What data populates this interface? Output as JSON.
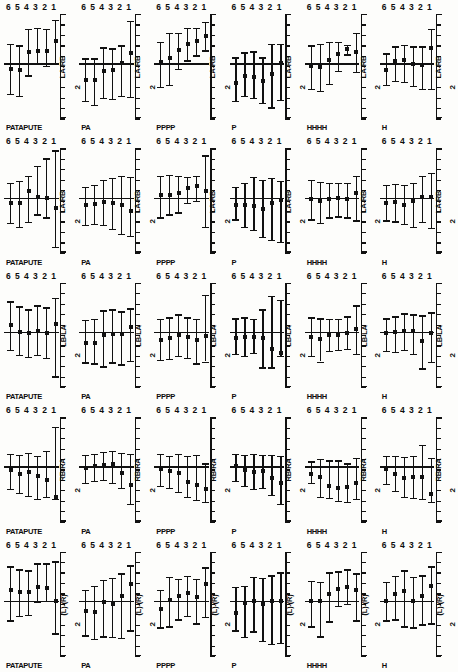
{
  "figure": {
    "title": "",
    "layout": {
      "rows": 5,
      "cols": 6
    }
  },
  "columns": [
    {
      "id": "col-1",
      "caption": "PATAPUTE"
    },
    {
      "id": "col-2",
      "caption": "PA"
    },
    {
      "id": "col-3",
      "caption": "PPPP"
    },
    {
      "id": "col-4",
      "caption": "P"
    },
    {
      "id": "col-5",
      "caption": "HHHH"
    },
    {
      "id": "col-6",
      "caption": "H"
    }
  ],
  "rows": [
    {
      "id": "row-1",
      "ylabel": "LA-RB",
      "yunit": "2"
    },
    {
      "id": "row-2",
      "ylabel": "LA-RB",
      "yunit": "2"
    },
    {
      "id": "row-3",
      "ylabel": "LB-LA",
      "yunit": "2"
    },
    {
      "id": "row-4",
      "ylabel": "RB-RA",
      "yunit": "2"
    },
    {
      "id": "row-5",
      "ylabel": "(L)-(R)",
      "yunit": "2"
    }
  ],
  "xticks": [
    "6",
    "5",
    "4",
    "3",
    "2",
    "1"
  ],
  "yaxis": {
    "tick_count": 11,
    "zero_index": 5
  },
  "chart_data": {
    "type": "scatter",
    "title": "",
    "xlabel": "",
    "ylabel": "effect",
    "x": [
      "6",
      "5",
      "4",
      "3",
      "2",
      "1"
    ],
    "ylim": [
      -1,
      1
    ],
    "grid": false,
    "legend": "none",
    "marker": "square",
    "errorbar": "vertical whisker with caps",
    "zero_reference_line": 0,
    "panels": [
      {
        "row": "LA-RB",
        "col": "PATAPUTE",
        "values": [
          -0.12,
          -0.14,
          0.22,
          0.24,
          0.24,
          0.45
        ],
        "lower": [
          -0.62,
          -0.66,
          -0.25,
          0.0,
          -0.05,
          0.0
        ],
        "upper": [
          0.4,
          0.36,
          0.7,
          0.72,
          0.7,
          0.88
        ]
      },
      {
        "row": "LA-RB",
        "col": "PA",
        "values": [
          -0.35,
          -0.34,
          -0.16,
          -0.14,
          0.0,
          0.2
        ],
        "lower": [
          -0.76,
          -0.84,
          -0.7,
          -0.72,
          -0.66,
          -0.68
        ],
        "upper": [
          0.1,
          0.1,
          0.32,
          0.3,
          0.36,
          0.86
        ]
      },
      {
        "row": "LA-RB",
        "col": "PPPP",
        "values": [
          0.02,
          0.1,
          0.26,
          0.4,
          0.45,
          0.56
        ],
        "lower": [
          -0.48,
          -0.44,
          -0.12,
          0.06,
          0.16,
          0.26
        ],
        "upper": [
          0.44,
          0.62,
          0.62,
          0.72,
          0.72,
          0.84
        ]
      },
      {
        "row": "LA-RB",
        "col": "P",
        "values": [
          -0.4,
          -0.26,
          -0.28,
          -0.36,
          -0.22,
          0.0
        ],
        "lower": [
          -0.76,
          -0.66,
          -0.7,
          -0.8,
          -0.9,
          -0.74
        ],
        "upper": [
          0.12,
          0.22,
          0.24,
          0.12,
          0.4,
          0.4
        ]
      },
      {
        "row": "LA-RB",
        "col": "HHHH",
        "values": [
          -0.06,
          -0.08,
          0.06,
          0.18,
          0.28,
          0.22
        ],
        "lower": [
          -0.52,
          -0.56,
          -0.42,
          -0.16,
          0.18,
          -0.18
        ],
        "upper": [
          0.36,
          0.4,
          0.44,
          0.44,
          0.38,
          0.62
        ]
      },
      {
        "row": "LA-RB",
        "col": "H",
        "values": [
          -0.14,
          0.04,
          0.06,
          -0.02,
          -0.04,
          0.3
        ],
        "lower": [
          -0.44,
          -0.36,
          -0.38,
          -0.46,
          -0.52,
          -0.52
        ],
        "upper": [
          0.2,
          0.34,
          0.38,
          0.34,
          0.34,
          0.7
        ]
      },
      {
        "row": "LA-RB",
        "col": "PATAPUTE",
        "values": [
          -0.1,
          -0.1,
          0.14,
          0.02,
          0.0,
          -0.22
        ],
        "lower": [
          -0.52,
          -0.6,
          -0.5,
          -0.34,
          -0.4,
          -1.0
        ],
        "upper": [
          0.3,
          0.34,
          0.44,
          0.64,
          0.8,
          0.96
        ]
      },
      {
        "row": "LA-RB",
        "col": "PA",
        "values": [
          -0.16,
          -0.14,
          -0.08,
          -0.1,
          -0.16,
          -0.28
        ],
        "lower": [
          -0.56,
          -0.54,
          -0.56,
          -0.64,
          -0.74,
          -0.78
        ],
        "upper": [
          0.22,
          0.26,
          0.36,
          0.4,
          0.44,
          0.42
        ]
      },
      {
        "row": "LA-RB",
        "col": "PPPP",
        "values": [
          0.06,
          0.06,
          0.1,
          0.2,
          0.24,
          0.14
        ],
        "lower": [
          -0.4,
          -0.34,
          -0.3,
          -0.1,
          -0.06,
          -0.6
        ],
        "upper": [
          0.44,
          0.46,
          0.44,
          0.42,
          0.44,
          0.86
        ]
      },
      {
        "row": "LA-RB",
        "col": "P",
        "values": [
          -0.16,
          -0.16,
          -0.18,
          -0.24,
          -0.1,
          -0.04
        ],
        "lower": [
          -0.44,
          -0.6,
          -0.66,
          -0.8,
          -0.86,
          -0.9
        ],
        "upper": [
          0.22,
          0.3,
          0.42,
          0.36,
          0.4,
          0.34
        ]
      },
      {
        "row": "LA-RB",
        "col": "HHHH",
        "values": [
          -0.02,
          -0.06,
          -0.02,
          0.0,
          -0.02,
          0.1
        ],
        "lower": [
          -0.44,
          -0.52,
          -0.4,
          -0.38,
          -0.4,
          -0.46
        ],
        "upper": [
          0.36,
          0.32,
          0.3,
          0.3,
          0.3,
          0.44
        ]
      },
      {
        "row": "LA-RB",
        "col": "H",
        "values": [
          -0.1,
          -0.08,
          -0.16,
          -0.06,
          0.02,
          0.02
        ],
        "lower": [
          -0.46,
          -0.48,
          -0.54,
          -0.6,
          -0.5,
          -0.62
        ],
        "upper": [
          0.26,
          0.28,
          0.26,
          0.3,
          0.44,
          0.5
        ]
      },
      {
        "row": "LB-LA",
        "col": "PATAPUTE",
        "values": [
          0.14,
          0.0,
          -0.02,
          0.02,
          -0.02,
          0.16
        ],
        "lower": [
          -0.36,
          -0.46,
          -0.5,
          -0.46,
          -0.52,
          -0.9
        ],
        "upper": [
          0.62,
          0.52,
          0.46,
          0.54,
          0.5,
          0.7
        ]
      },
      {
        "row": "LB-LA",
        "col": "PA",
        "values": [
          -0.22,
          -0.22,
          -0.06,
          -0.04,
          -0.04,
          0.1
        ],
        "lower": [
          -0.62,
          -0.64,
          -0.7,
          -0.62,
          -0.66,
          -0.58
        ],
        "upper": [
          0.24,
          0.26,
          0.44,
          0.46,
          0.42,
          0.48
        ]
      },
      {
        "row": "LB-LA",
        "col": "PPPP",
        "values": [
          -0.16,
          -0.12,
          -0.06,
          -0.1,
          -0.16,
          -0.08
        ],
        "lower": [
          -0.56,
          -0.54,
          -0.48,
          -0.52,
          -0.64,
          -0.6
        ],
        "upper": [
          0.26,
          0.3,
          0.36,
          0.3,
          0.26,
          0.76
        ]
      },
      {
        "row": "LB-LA",
        "col": "P",
        "values": [
          -0.12,
          -0.1,
          -0.1,
          -0.12,
          -0.34,
          -0.42
        ],
        "lower": [
          -0.44,
          -0.48,
          -0.42,
          -0.72,
          -0.72,
          -0.48
        ],
        "upper": [
          0.28,
          0.3,
          0.26,
          0.46,
          0.74,
          0.66
        ]
      },
      {
        "row": "LB-LA",
        "col": "HHHH",
        "values": [
          -0.1,
          -0.14,
          -0.06,
          -0.06,
          -0.02,
          0.06
        ],
        "lower": [
          -0.48,
          -0.6,
          -0.38,
          -0.36,
          -0.34,
          -0.44
        ],
        "upper": [
          0.3,
          0.28,
          0.26,
          0.26,
          0.32,
          0.54
        ]
      },
      {
        "row": "LB-LA",
        "col": "H",
        "values": [
          -0.02,
          0.0,
          0.02,
          0.02,
          -0.18,
          -0.02
        ],
        "lower": [
          -0.38,
          -0.4,
          -0.36,
          -0.44,
          -0.74,
          -0.6
        ],
        "upper": [
          0.28,
          0.32,
          0.38,
          0.36,
          0.34,
          0.4
        ]
      },
      {
        "row": "RB-RA",
        "col": "PATAPUTE",
        "values": [
          -0.08,
          -0.16,
          -0.12,
          -0.2,
          -0.28,
          -0.62
        ],
        "lower": [
          -0.46,
          -0.54,
          -0.6,
          -0.66,
          -0.62,
          -0.66
        ],
        "upper": [
          0.26,
          0.24,
          0.28,
          0.22,
          0.32,
          0.8
        ]
      },
      {
        "row": "RB-RA",
        "col": "PA",
        "values": [
          -0.04,
          0.0,
          0.02,
          0.04,
          -0.14,
          -0.38
        ],
        "lower": [
          -0.34,
          -0.3,
          -0.28,
          -0.34,
          -0.44,
          -0.76
        ],
        "upper": [
          0.24,
          0.26,
          0.3,
          0.32,
          0.28,
          0.26
        ]
      },
      {
        "row": "RB-RA",
        "col": "PPPP",
        "values": [
          -0.06,
          -0.1,
          -0.14,
          -0.32,
          -0.38,
          -0.46
        ],
        "lower": [
          -0.4,
          -0.44,
          -0.52,
          -0.62,
          -0.68,
          -0.72
        ],
        "upper": [
          0.26,
          0.22,
          0.26,
          0.22,
          0.24,
          0.06
        ]
      },
      {
        "row": "RB-RA",
        "col": "P",
        "values": [
          0.0,
          -0.08,
          -0.12,
          -0.1,
          -0.24,
          -0.34
        ],
        "lower": [
          -0.3,
          -0.4,
          -0.46,
          -0.44,
          -0.58,
          -0.76
        ],
        "upper": [
          0.26,
          0.24,
          0.26,
          0.24,
          0.24,
          0.22
        ]
      },
      {
        "row": "RB-RA",
        "col": "HHHH",
        "values": [
          -0.16,
          -0.22,
          -0.4,
          -0.44,
          -0.42,
          -0.34
        ],
        "lower": [
          -0.34,
          -0.62,
          -0.64,
          -0.7,
          -0.72,
          -0.66
        ],
        "upper": [
          0.1,
          0.16,
          0.12,
          0.12,
          0.06,
          0.18
        ]
      },
      {
        "row": "RB-RA",
        "col": "H",
        "values": [
          -0.06,
          -0.16,
          -0.24,
          -0.22,
          -0.22,
          -0.56
        ],
        "lower": [
          -0.36,
          -0.5,
          -0.62,
          -0.64,
          -0.66,
          -0.72
        ],
        "upper": [
          0.22,
          0.22,
          0.2,
          0.22,
          0.44,
          0.18
        ]
      },
      {
        "row": "(L)-(R)",
        "col": "PATAPUTE",
        "values": [
          0.22,
          0.18,
          0.18,
          0.28,
          0.26,
          0.0
        ],
        "lower": [
          -0.4,
          -0.3,
          -0.28,
          -0.02,
          0.0,
          -0.66
        ],
        "upper": [
          0.7,
          0.64,
          0.62,
          0.76,
          0.76,
          0.8
        ]
      },
      {
        "row": "(L)-(R)",
        "col": "PA",
        "values": [
          -0.2,
          -0.22,
          -0.02,
          -0.06,
          0.1,
          0.34
        ],
        "lower": [
          -0.7,
          -0.78,
          -0.72,
          -0.74,
          -0.76,
          -0.6
        ],
        "upper": [
          0.22,
          0.3,
          0.42,
          0.46,
          0.56,
          0.72
        ]
      },
      {
        "row": "(L)-(R)",
        "col": "PPPP",
        "values": [
          -0.16,
          0.02,
          0.1,
          0.16,
          0.08,
          0.34
        ],
        "lower": [
          -0.54,
          -0.52,
          -0.38,
          -0.3,
          -0.46,
          -0.32
        ],
        "upper": [
          0.22,
          0.48,
          0.44,
          0.5,
          0.44,
          0.68
        ]
      },
      {
        "row": "(L)-(R)",
        "col": "P",
        "values": [
          -0.24,
          -0.04,
          0.0,
          -0.06,
          0.0,
          0.0
        ],
        "lower": [
          -0.6,
          -0.74,
          -0.62,
          -0.82,
          -0.88,
          -0.86
        ],
        "upper": [
          0.28,
          0.3,
          0.48,
          0.46,
          0.52,
          0.58
        ]
      },
      {
        "row": "(L)-(R)",
        "col": "HHHH",
        "values": [
          0.0,
          0.0,
          0.14,
          0.24,
          0.28,
          0.22
        ],
        "lower": [
          -0.52,
          -0.72,
          -0.42,
          -0.1,
          -0.06,
          -0.4
        ],
        "upper": [
          0.4,
          0.38,
          0.58,
          0.6,
          0.64,
          0.56
        ]
      },
      {
        "row": "(L)-(R)",
        "col": "H",
        "values": [
          0.0,
          0.14,
          0.2,
          0.0,
          0.1,
          0.3
        ],
        "lower": [
          -0.4,
          -0.38,
          -0.52,
          -0.54,
          -0.48,
          -0.46
        ],
        "upper": [
          0.38,
          0.5,
          0.62,
          0.48,
          0.52,
          0.7
        ]
      }
    ]
  }
}
